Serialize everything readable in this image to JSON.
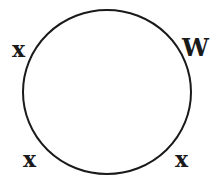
{
  "diagram": {
    "type": "circle-with-labels",
    "stroke_color": "#1a1a1a",
    "circle": {
      "cx": 107,
      "cy": 92,
      "r": 84
    },
    "labels": [
      {
        "id": "upper-left",
        "text": "x"
      },
      {
        "id": "upper-right",
        "text": "W"
      },
      {
        "id": "lower-left",
        "text": "x"
      },
      {
        "id": "lower-right",
        "text": "x"
      }
    ]
  }
}
